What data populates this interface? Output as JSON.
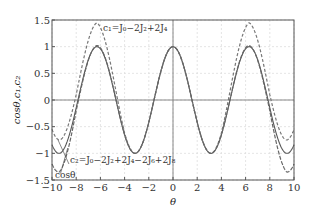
{
  "chart_data": {
    "type": "line",
    "title": "",
    "xlabel": "θ",
    "ylabel": "cosθ, c1, c2",
    "xlim": [
      -10,
      10
    ],
    "ylim": [
      -1.5,
      1.5
    ],
    "xticks": [
      -10,
      -8,
      -6,
      -4,
      -2,
      0,
      2,
      4,
      6,
      8,
      10
    ],
    "yticks": [
      -1.5,
      -1,
      -0.5,
      0,
      0.5,
      1,
      1.5
    ],
    "ytick_labels": [
      "−1.5",
      "−1",
      "−0.5",
      "0",
      "0.5",
      "1",
      "1.5"
    ],
    "xtick_labels": [
      "−10",
      "−8",
      "−6",
      "−4",
      "−2",
      "0",
      "2",
      "4",
      "6",
      "8",
      "10"
    ],
    "grid": true,
    "series": [
      {
        "name": "cosθ",
        "style": "solid",
        "color": "#555555",
        "x": [
          -10,
          -8,
          -6,
          -4,
          -3.14,
          -2,
          0,
          2,
          3.14,
          4,
          6,
          8,
          10
        ],
        "values": [
          -0.84,
          -0.15,
          0.96,
          -0.65,
          -1.0,
          -0.42,
          1.0,
          -0.42,
          -1.0,
          -0.65,
          0.96,
          -0.15,
          -0.84
        ]
      },
      {
        "name": "c1=J0−2J2+2J4",
        "style": "dashed",
        "color": "#777777",
        "x": [
          -10,
          -9.4,
          -8,
          -6.28,
          -4,
          -3.14,
          -2,
          0,
          2,
          3.14,
          4,
          6.28,
          8,
          9.4,
          10
        ],
        "values": [
          -0.55,
          -0.75,
          0.1,
          1.45,
          -0.62,
          -1.0,
          -0.42,
          1.0,
          -0.42,
          -1.0,
          -0.62,
          1.45,
          0.1,
          -0.75,
          -0.55
        ]
      },
      {
        "name": "c2=J0−2J2+2J4−2J6+2J8",
        "style": "dash-dot",
        "color": "#666666",
        "x": [
          -10,
          -9.4,
          -8,
          -6.28,
          -4,
          -3.14,
          -2,
          0,
          2,
          3.14,
          4,
          6.28,
          8,
          9.4,
          10
        ],
        "values": [
          -1.2,
          -1.35,
          -0.2,
          1.02,
          -0.65,
          -1.0,
          -0.42,
          1.0,
          -0.42,
          -1.0,
          -0.65,
          1.02,
          -0.2,
          -1.35,
          -1.2
        ]
      }
    ],
    "annotations": [
      {
        "text": "c1=J0−2J2+2J4",
        "x": -5.6,
        "y": 1.35
      },
      {
        "text": "c2=J0−2J2+2J4−2J6+2J8",
        "x": -8.8,
        "y": -1.1
      },
      {
        "text": "cosθ",
        "x": -9.6,
        "y": -1.4
      }
    ],
    "legend": "none (inline annotations)"
  },
  "labels": {
    "xlabel": "θ",
    "ylabel": "cosθ,c₁,c₂",
    "ann_c1": "c₁=J₀−2J₂+2J₄",
    "ann_c2": "c₂=J₀−2J₂+2J₄−2J₆+2J₈",
    "ann_cos": "cosθ"
  }
}
